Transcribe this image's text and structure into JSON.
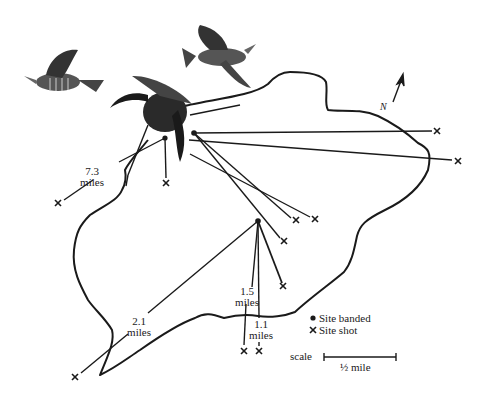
{
  "map": {
    "subject": "Grouse banding and recovery sites",
    "north_label": "N",
    "distance_labels": [
      {
        "value": "7.3",
        "unit": "miles"
      },
      {
        "value": "2.1",
        "unit": "miles"
      },
      {
        "value": "1.5",
        "unit": "miles"
      },
      {
        "value": "1.1",
        "unit": "miles"
      }
    ],
    "legend": {
      "banded": {
        "icon": "filled-dot-icon",
        "label": "Site banded"
      },
      "shot": {
        "icon": "x-mark-icon",
        "label": "Site shot"
      }
    },
    "scale": {
      "label": "scale",
      "value": "½ mile"
    },
    "banding_sites": [
      {
        "id": "A",
        "x": 165,
        "y": 138
      },
      {
        "id": "B",
        "x": 194,
        "y": 133
      },
      {
        "id": "C",
        "x": 258,
        "y": 221
      }
    ],
    "shot_sites": [
      {
        "from": "B",
        "x": 437,
        "y": 131
      },
      {
        "from": "B",
        "x": 458,
        "y": 161
      },
      {
        "from": "B",
        "x": 296,
        "y": 220
      },
      {
        "from": "B",
        "x": 315,
        "y": 219
      },
      {
        "from": "B",
        "x": 284,
        "y": 241
      },
      {
        "from": "A",
        "x": 166,
        "y": 183
      },
      {
        "from": "A",
        "x": 58,
        "y": 203
      },
      {
        "from": "C",
        "x": 283,
        "y": 286
      },
      {
        "from": "C",
        "x": 75,
        "y": 377
      },
      {
        "from": "C",
        "x": 244,
        "y": 351
      },
      {
        "from": "C",
        "x": 259,
        "y": 351
      }
    ],
    "illustrations": [
      "grouse-flying-left",
      "grouse-flying-right",
      "grouse-wings-raised"
    ],
    "colors": {
      "ink": "#1a1a1a",
      "paper": "#ffffff"
    }
  }
}
